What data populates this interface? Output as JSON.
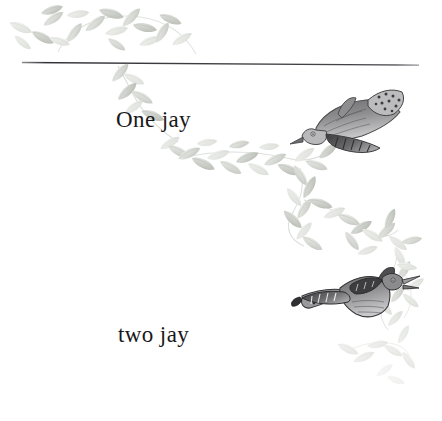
{
  "page": {
    "background_color": "#ffffff",
    "width": 442,
    "height": 421,
    "kind": "scanned-storybook-page"
  },
  "rule": {
    "name": "horizontal-rule",
    "color": "#3a3a3e",
    "x_start": 22,
    "y_start": 62,
    "x_end": 419,
    "y_end": 65,
    "thickness": 1.2
  },
  "captions": [
    {
      "id": "one-jay",
      "text": "One jay",
      "x": 116,
      "y": 107,
      "font_size": 23
    },
    {
      "id": "two-jay",
      "text": "two jay",
      "x": 118,
      "y": 322,
      "font_size": 23
    }
  ],
  "illustrations": {
    "birds": [
      {
        "id": "jay-upper",
        "label": "jay-bird-diving-left",
        "x": 305,
        "y": 88,
        "width": 96,
        "height": 72,
        "ink_color": "#4a4a4c",
        "orientation": "head-down-left"
      },
      {
        "id": "jay-lower",
        "label": "jay-bird-flying-right-calling",
        "x": 302,
        "y": 268,
        "width": 100,
        "height": 60,
        "ink_color": "#37373a",
        "orientation": "head-up-right-beak-open"
      }
    ],
    "foliage": {
      "label": "pale-leaf-vine-decoration",
      "leaf_color_light": "#dcdedb",
      "leaf_color_mid": "#c6cac3",
      "leaf_color_dark": "#a9aea6",
      "stem_color": "#cfd2cd",
      "clusters": [
        {
          "id": "vine-top-arc",
          "description": "arc of leaves above the rule, upper-left"
        },
        {
          "id": "vine-descending",
          "description": "vine descending diagonally from rule past One jay"
        },
        {
          "id": "vine-midright",
          "description": "long vine sweeping down to the right past the upper jay"
        },
        {
          "id": "vine-lowerright",
          "description": "vine curling around the lower jay and fading bottom-right"
        }
      ]
    }
  },
  "colors": {
    "ink": "#19181a",
    "rule": "#3a3a3e",
    "leaf": "#c6cac3",
    "paper": "#ffffff"
  }
}
